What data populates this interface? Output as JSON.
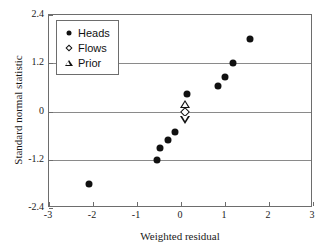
{
  "chart_data": {
    "type": "scatter",
    "title": "",
    "xlabel": "Weighted residual",
    "ylabel": "Standard normal statistic",
    "xlim": [
      -3,
      3
    ],
    "ylim": [
      -2.4,
      2.4
    ],
    "xticks": [
      "-3",
      "-2",
      "-1",
      "0",
      "1",
      "2",
      "3"
    ],
    "xtick_values": [
      -3,
      -2,
      -1,
      0,
      1,
      2,
      3
    ],
    "yticks": [
      "2.4",
      "1.2",
      "0",
      "-1.2",
      "-2.4"
    ],
    "ytick_values": [
      2.4,
      1.2,
      0,
      -1.2,
      -2.4
    ],
    "grid": "horizontal-only",
    "legend_position": "upper-left",
    "series": [
      {
        "name": "Heads",
        "marker": "filled-circle",
        "color": "#111111",
        "points": [
          {
            "x": -2.08,
            "y": -1.8
          },
          {
            "x": -0.55,
            "y": -1.2
          },
          {
            "x": -0.47,
            "y": -0.9
          },
          {
            "x": -0.3,
            "y": -0.7
          },
          {
            "x": -0.13,
            "y": -0.52
          },
          {
            "x": 0.13,
            "y": 0.43
          },
          {
            "x": 0.85,
            "y": 0.63
          },
          {
            "x": 1.0,
            "y": 0.87
          },
          {
            "x": 1.18,
            "y": 1.2
          },
          {
            "x": 1.57,
            "y": 1.8
          }
        ]
      },
      {
        "name": "Flows",
        "marker": "open-diamond",
        "color": "#111111",
        "points": [
          {
            "x": 0.09,
            "y": 0.0
          }
        ]
      },
      {
        "name": "Prior",
        "marker": "open-triangle",
        "color": "#111111",
        "points": [
          {
            "x": 0.1,
            "y": 0.18
          },
          {
            "x": 0.1,
            "y": -0.2
          }
        ]
      }
    ]
  },
  "legend": {
    "items": [
      {
        "label": "Heads",
        "symbol": "filled-circle-icon"
      },
      {
        "label": "Flows",
        "symbol": "open-diamond-icon"
      },
      {
        "label": "Prior",
        "symbol": "open-triangle-icon"
      }
    ]
  },
  "colors": {
    "marker": "#111111",
    "gridline": "#8a8a8a",
    "axis": "#6d6d6d",
    "background": "#ffffff",
    "text": "#1a1a1a"
  }
}
